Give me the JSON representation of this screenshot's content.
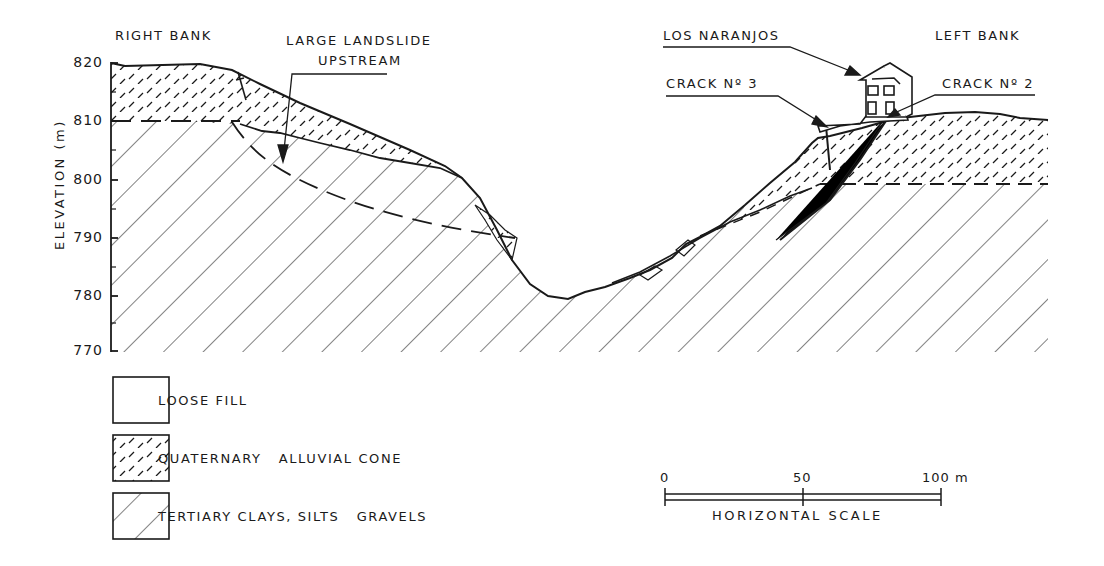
{
  "labels": {
    "right_bank": "RIGHT BANK",
    "left_bank": "LEFT BANK",
    "landslide_line1": "LARGE LANDSLIDE",
    "landslide_line2": "UPSTREAM",
    "los_naranjos": "LOS NARANJOS",
    "crack3": "CRACK Nº 3",
    "crack2": "CRACK Nº 2"
  },
  "axis": {
    "ylabel": "ELEVATION (m)",
    "ticks": [
      "820",
      "810",
      "800",
      "790",
      "780",
      "770"
    ]
  },
  "legend": {
    "items": [
      {
        "label": "LOOSE FILL",
        "pattern": "blank"
      },
      {
        "label": "QUATERNARY   ALLUVIAL CONE",
        "pattern": "dashes"
      },
      {
        "label": "TERTIARY CLAYS, SILTS   GRAVELS",
        "pattern": "diagonal-hatch"
      }
    ]
  },
  "scale": {
    "ticks": [
      "0",
      "50",
      "100 m"
    ],
    "title": "HORIZONTAL SCALE"
  },
  "colors": {
    "ink": "#1a1a1a",
    "background": "#ffffff"
  }
}
